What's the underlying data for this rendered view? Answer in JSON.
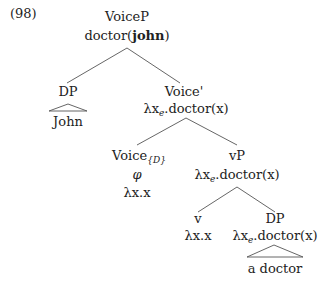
{
  "example_number": "(98)",
  "tree": {
    "root": {
      "label": "VoiceP",
      "denotation_prefix": "doctor(",
      "denotation_bold": "john",
      "denotation_suffix": ")"
    },
    "dp_subject": {
      "label": "DP",
      "terminal": "John"
    },
    "voice_bar": {
      "label": "Voice'",
      "lambda": "λx",
      "sub": "e",
      "body": ".doctor(x)"
    },
    "voice_head": {
      "label": "Voice",
      "sub": "{D}",
      "phon": "φ",
      "denotation": "λx.x"
    },
    "vp": {
      "label": "vP",
      "lambda": "λx",
      "sub": "e",
      "body": ".doctor(x)"
    },
    "v_head": {
      "label": "v",
      "denotation": "λx.x"
    },
    "dp_object": {
      "label": "DP",
      "lambda": "λx",
      "sub": "e",
      "body": ".doctor(x)",
      "terminal": "a doctor"
    }
  }
}
